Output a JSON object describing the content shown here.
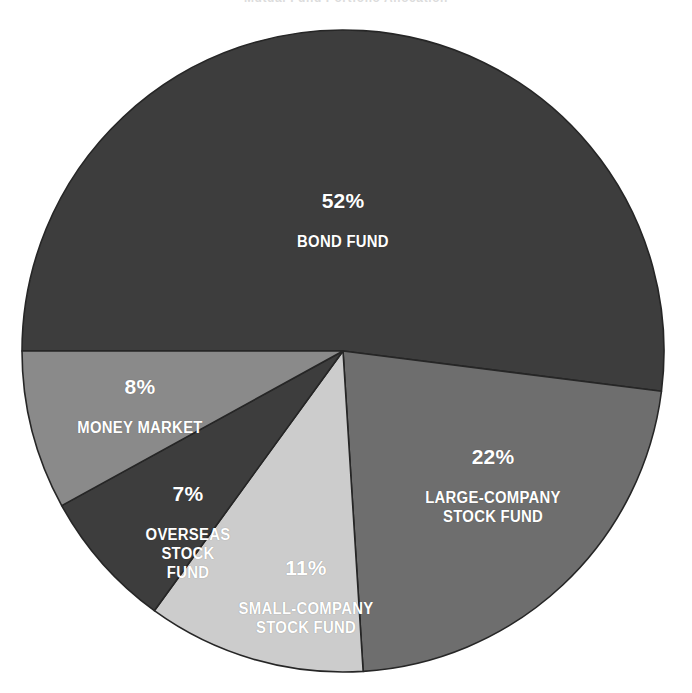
{
  "caption": {
    "clipped_top_text": "Mutual Fund Portfolio Allocation"
  },
  "chart_data": {
    "type": "pie",
    "title": "",
    "subtitle": "",
    "xlabel": "",
    "ylabel": "",
    "legend_position": "none",
    "labels_inside_slices": true,
    "unit": "%",
    "categories": [
      "BOND FUND",
      "LARGE-COMPANY STOCK FUND",
      "SMALL-COMPANY STOCK FUND",
      "OVERSEAS STOCK FUND",
      "MONEY MARKET"
    ],
    "values": [
      52,
      22,
      11,
      7,
      8
    ],
    "slices": [
      {
        "id": "bond-fund",
        "percent_label": "52%",
        "name_label": "BOND FUND",
        "value": 52,
        "color": "#3d3d3d",
        "label_color": "#ffffff",
        "start_angle_deg": 180,
        "sweep_deg": 187.2
      },
      {
        "id": "large-company-stock-fund",
        "percent_label": "22%",
        "name_label": "LARGE-COMPANY\nSTOCK FUND",
        "value": 22,
        "color": "#6e6e6e",
        "label_color": "#ffffff",
        "start_angle_deg": 7.2,
        "sweep_deg": 79.2
      },
      {
        "id": "small-company-stock-fund",
        "percent_label": "11%",
        "name_label": "SMALL-COMPANY\nSTOCK FUND",
        "value": 11,
        "color": "#cccccc",
        "label_color": "#ffffff",
        "start_angle_deg": 86.4,
        "sweep_deg": 39.6
      },
      {
        "id": "overseas-stock-fund",
        "percent_label": "7%",
        "name_label": "OVERSEAS\nSTOCK\nFUND",
        "value": 7,
        "color": "#3d3d3d",
        "label_color": "#ffffff",
        "start_angle_deg": 126,
        "sweep_deg": 25.2
      },
      {
        "id": "money-market",
        "percent_label": "8%",
        "name_label": "MONEY MARKET",
        "value": 8,
        "color": "#8a8a8a",
        "label_color": "#ffffff",
        "start_angle_deg": 151.2,
        "sweep_deg": 28.8
      }
    ],
    "geometry": {
      "center_x": 343,
      "center_y": 351,
      "radius": 321
    },
    "colors": {
      "background": "#ffffff",
      "outline": "#262626",
      "bond_fund": "#3d3d3d",
      "large_company": "#6e6e6e",
      "small_company": "#cccccc",
      "overseas": "#3d3d3d",
      "money_market": "#8a8a8a"
    }
  }
}
